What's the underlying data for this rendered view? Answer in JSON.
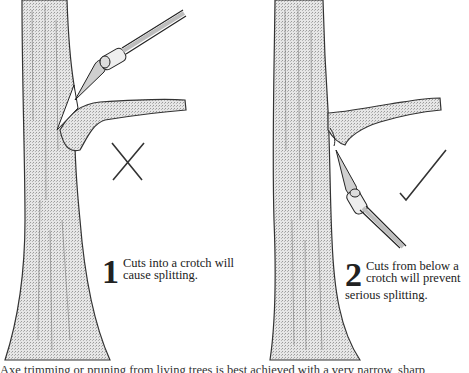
{
  "figure": {
    "panels": [
      {
        "id": 1,
        "number": "1",
        "caption_line1": "Cuts into a crotch will",
        "caption_line2": "cause splitting.",
        "mark": "cross-mark",
        "verdict": "incorrect"
      },
      {
        "id": 2,
        "number": "2",
        "caption_line1": "Cuts from below a",
        "caption_line2": "crotch will prevent",
        "caption_line3": "serious splitting.",
        "mark": "check-mark",
        "verdict": "correct"
      }
    ],
    "footer_text_partial": "Axe trimming or pruning from living trees is best achieved with a very narrow, sharp"
  },
  "colors": {
    "ink": "#1a1a1a",
    "bark_fill": "#d9d9d9",
    "background": "#ffffff"
  }
}
